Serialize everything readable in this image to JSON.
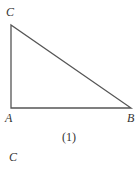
{
  "figure": {
    "caption": "(1)",
    "vertices": {
      "C": {
        "label": "C"
      },
      "A": {
        "label": "A"
      },
      "B": {
        "label": "B"
      }
    },
    "next_figure_label": "C",
    "stroke_color": "#555555"
  }
}
